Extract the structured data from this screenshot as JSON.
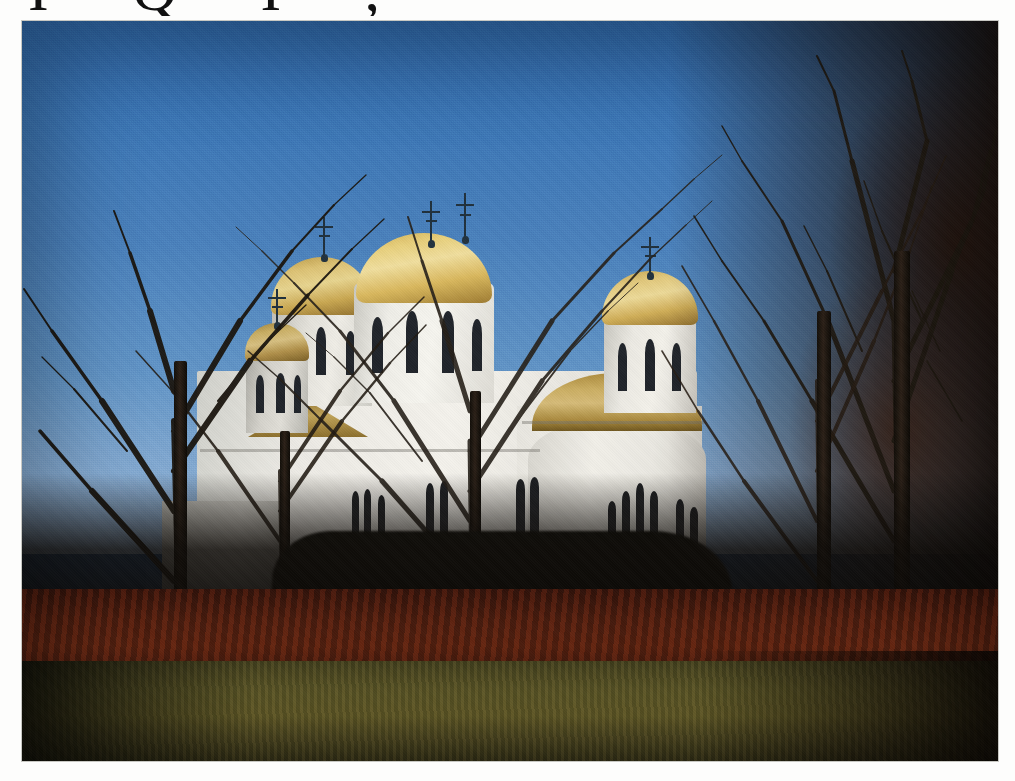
{
  "page": {
    "background_color": "#fdfdfc",
    "width": 1015,
    "height": 781,
    "cut_off_header_text": "I  Q  I ,"
  },
  "photograph": {
    "name": "orthodox-church-photo",
    "subject": "White Orthodox church with golden domes",
    "season": "late autumn / early winter",
    "frame": {
      "left": 22,
      "top": 21,
      "width": 976,
      "height": 740,
      "border_color": "#bebeb9"
    },
    "sky": {
      "label": "clear blue sky",
      "top_color": "#2f69ab",
      "mid_color": "#4a81bc",
      "horizon_color": "#9db9d8"
    },
    "church": {
      "label": "Serbian Orthodox church",
      "wall_color": "#f2f0e9",
      "dome_color": "#e8d07d",
      "dome_shadow_color": "#9e7c32",
      "cross_color": "#20303c",
      "window_color": "#20242a",
      "domes": [
        {
          "name": "main-dome",
          "crosses": 2
        },
        {
          "name": "secondary-dome",
          "crosses": 1
        },
        {
          "name": "right-tower-dome",
          "crosses": 1
        },
        {
          "name": "left-tower-dome",
          "crosses": 1
        },
        {
          "name": "apse-half-dome",
          "crosses": 0
        }
      ]
    },
    "foreground": {
      "trees_label": "bare deciduous trees",
      "trunk_color": "#2b2017",
      "leaf_litter_color": "#6d2c13",
      "grass_color": "#6a6129",
      "right_tree_mass_color": "#221310"
    }
  }
}
